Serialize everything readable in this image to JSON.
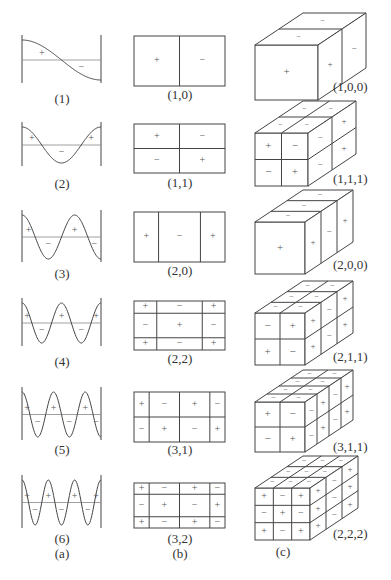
{
  "figure": {
    "stroke_color": "#444444",
    "axis_color": "#888888",
    "sign_color": "#555555",
    "column_labels": [
      "(a)",
      "(b)",
      "(c)"
    ],
    "column_a": {
      "title": "(a)",
      "modes": [
        {
          "label": "(1)",
          "n": 1,
          "signs": [
            "+",
            "−"
          ]
        },
        {
          "label": "(2)",
          "n": 2,
          "signs": [
            "+",
            "−",
            "+"
          ]
        },
        {
          "label": "(3)",
          "n": 3,
          "signs": [
            "+",
            "−",
            "+",
            "−"
          ]
        },
        {
          "label": "(4)",
          "n": 4,
          "signs": [
            "+",
            "−",
            "+",
            "−",
            "+"
          ]
        },
        {
          "label": "(5)",
          "n": 5,
          "signs": [
            "+",
            "−",
            "+",
            "−",
            "+",
            "−"
          ]
        },
        {
          "label": "(6)",
          "n": 6,
          "signs": [
            "+",
            "−",
            "+",
            "−",
            "+",
            "−",
            "+"
          ]
        }
      ]
    },
    "column_b": {
      "title": "(b)",
      "modes": [
        {
          "label": "(1,0)",
          "m": 1,
          "n": 0,
          "grid": [
            [
              "+",
              "−"
            ]
          ]
        },
        {
          "label": "(1,1)",
          "m": 1,
          "n": 1,
          "grid": [
            [
              "+",
              "−"
            ],
            [
              "−",
              "+"
            ]
          ]
        },
        {
          "label": "(2,0)",
          "m": 2,
          "n": 0,
          "grid": [
            [
              "+",
              "−",
              "+"
            ]
          ]
        },
        {
          "label": "(2,2)",
          "m": 2,
          "n": 2,
          "grid": [
            [
              "+",
              "−",
              "+"
            ],
            [
              "−",
              "+",
              "−"
            ],
            [
              "+",
              "−",
              "+"
            ]
          ]
        },
        {
          "label": "(3,1)",
          "m": 3,
          "n": 1,
          "grid": [
            [
              "+",
              "−",
              "+",
              "−"
            ],
            [
              "−",
              "+",
              "−",
              "+"
            ]
          ]
        },
        {
          "label": "(3,2)",
          "m": 3,
          "n": 2,
          "grid": [
            [
              "+",
              "−",
              "+",
              "−"
            ],
            [
              "−",
              "+",
              "−",
              "+"
            ],
            [
              "+",
              "−",
              "+",
              "−"
            ]
          ]
        }
      ]
    },
    "column_c": {
      "title": "(c)",
      "modes": [
        {
          "label": "(1,0,0)",
          "l": 1,
          "m": 0,
          "n": 0,
          "front": [
            [
              "+"
            ]
          ]
        },
        {
          "label": "(1,1,1)",
          "l": 1,
          "m": 1,
          "n": 1,
          "front": [
            [
              "+",
              "−"
            ],
            [
              "−",
              "+"
            ]
          ]
        },
        {
          "label": "(2,0,0)",
          "l": 2,
          "m": 0,
          "n": 0,
          "front": [
            [
              "+"
            ]
          ]
        },
        {
          "label": "(2,1,1)",
          "l": 2,
          "m": 1,
          "n": 1,
          "front": [
            [
              "−",
              "+"
            ],
            [
              "+",
              "−"
            ]
          ]
        },
        {
          "label": "(3,1,1)",
          "l": 3,
          "m": 1,
          "n": 1,
          "front": [
            [
              "+",
              "−"
            ],
            [
              "−",
              "+"
            ]
          ]
        },
        {
          "label": "(2,2,2)",
          "l": 2,
          "m": 2,
          "n": 2,
          "front": [
            [
              "+",
              "−",
              "+"
            ],
            [
              "−",
              "+",
              "−"
            ],
            [
              "+",
              "−",
              "+"
            ]
          ]
        }
      ]
    }
  }
}
